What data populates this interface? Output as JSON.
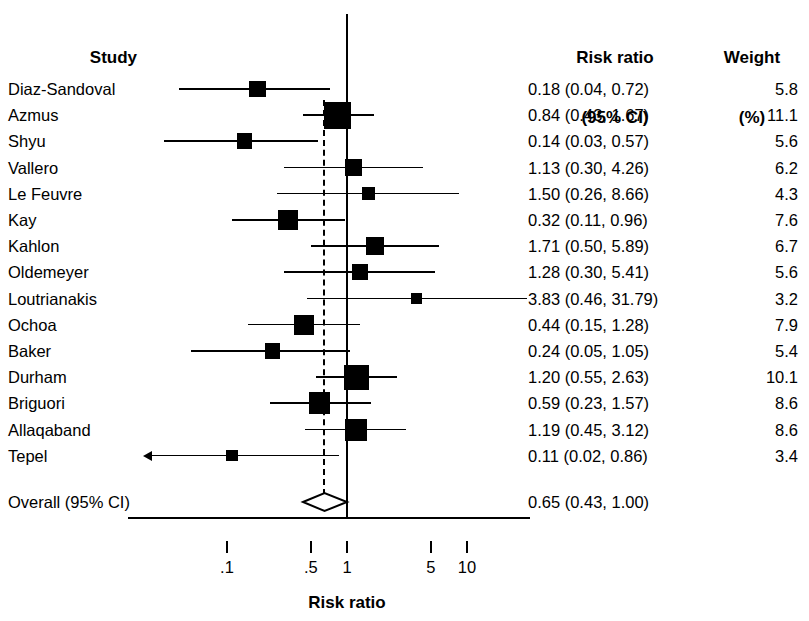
{
  "headers": {
    "study": "Study",
    "risk_ratio_line1": "Risk ratio",
    "risk_ratio_line2": "(95% CI)",
    "weight_line1": "Weight",
    "weight_line2": "(%)"
  },
  "overall": {
    "label": "Overall (95% CI)",
    "rr_text": "0.65 (0.43, 1.00)",
    "estimate": 0.65,
    "lower": 0.43,
    "upper": 1.0
  },
  "axis": {
    "title": "Risk ratio",
    "ticks": [
      ".1",
      ".5",
      "1",
      "5",
      "10"
    ],
    "tick_values": [
      0.1,
      0.5,
      1,
      5,
      10
    ],
    "scale": "log",
    "xmin": 0.07,
    "xmax": 17.0,
    "null_value": 1
  },
  "colors": {
    "ink": "#000000",
    "background": "#ffffff"
  },
  "chart_data": {
    "type": "forest",
    "title": "",
    "xlabel": "Risk ratio",
    "ylabel": "",
    "scale": "log",
    "xlim": [
      0.07,
      17.0
    ],
    "grid": false,
    "legend": "none",
    "null_line": 1,
    "pooled_line": 0.65,
    "columns": [
      "Study",
      "Risk ratio (95% CI)",
      "Weight (%)"
    ],
    "studies": [
      {
        "study": "Diaz-Sandoval",
        "rr": 0.18,
        "lower": 0.04,
        "upper": 0.72,
        "weight": 5.8,
        "rr_text": "0.18 (0.04, 0.72)",
        "weight_text": "5.8",
        "truncated_left": false,
        "truncated_right": false
      },
      {
        "study": "Azmus",
        "rr": 0.84,
        "lower": 0.43,
        "upper": 1.67,
        "weight": 11.1,
        "rr_text": "0.84 (0.43, 1.67)",
        "weight_text": "11.1",
        "truncated_left": false,
        "truncated_right": false
      },
      {
        "study": "Shyu",
        "rr": 0.14,
        "lower": 0.03,
        "upper": 0.57,
        "weight": 5.6,
        "rr_text": "0.14 (0.03, 0.57)",
        "weight_text": "5.6",
        "truncated_left": false,
        "truncated_right": false
      },
      {
        "study": "Vallero",
        "rr": 1.13,
        "lower": 0.3,
        "upper": 4.26,
        "weight": 6.2,
        "rr_text": "1.13 (0.30, 4.26)",
        "weight_text": "6.2",
        "truncated_left": false,
        "truncated_right": false
      },
      {
        "study": "Le Feuvre",
        "rr": 1.5,
        "lower": 0.26,
        "upper": 8.66,
        "weight": 4.3,
        "rr_text": "1.50 (0.26, 8.66)",
        "weight_text": "4.3",
        "truncated_left": false,
        "truncated_right": false
      },
      {
        "study": "Kay",
        "rr": 0.32,
        "lower": 0.11,
        "upper": 0.96,
        "weight": 7.6,
        "rr_text": "0.32 (0.11, 0.96)",
        "weight_text": "7.6",
        "truncated_left": false,
        "truncated_right": false
      },
      {
        "study": "Kahlon",
        "rr": 1.71,
        "lower": 0.5,
        "upper": 5.89,
        "weight": 6.7,
        "rr_text": "1.71 (0.50, 5.89)",
        "weight_text": "6.7",
        "truncated_left": false,
        "truncated_right": false
      },
      {
        "study": "Oldemeyer",
        "rr": 1.28,
        "lower": 0.3,
        "upper": 5.41,
        "weight": 5.6,
        "rr_text": "1.28 (0.30, 5.41)",
        "weight_text": "5.6",
        "truncated_left": false,
        "truncated_right": false
      },
      {
        "study": "Loutrianakis",
        "rr": 3.83,
        "lower": 0.46,
        "upper": 31.79,
        "weight": 3.2,
        "rr_text": "3.83 (0.46, 31.79)",
        "weight_text": "3.2",
        "truncated_left": false,
        "truncated_right": true
      },
      {
        "study": "Ochoa",
        "rr": 0.44,
        "lower": 0.15,
        "upper": 1.28,
        "weight": 7.9,
        "rr_text": "0.44 (0.15, 1.28)",
        "weight_text": "7.9",
        "truncated_left": false,
        "truncated_right": false
      },
      {
        "study": "Baker",
        "rr": 0.24,
        "lower": 0.05,
        "upper": 1.05,
        "weight": 5.4,
        "rr_text": "0.24 (0.05, 1.05)",
        "weight_text": "5.4",
        "truncated_left": false,
        "truncated_right": false
      },
      {
        "study": "Durham",
        "rr": 1.2,
        "lower": 0.55,
        "upper": 2.63,
        "weight": 10.1,
        "rr_text": "1.20 (0.55, 2.63)",
        "weight_text": "10.1",
        "truncated_left": false,
        "truncated_right": false
      },
      {
        "study": "Briguori",
        "rr": 0.59,
        "lower": 0.23,
        "upper": 1.57,
        "weight": 8.6,
        "rr_text": "0.59 (0.23, 1.57)",
        "weight_text": "8.6",
        "truncated_left": false,
        "truncated_right": false
      },
      {
        "study": "Allaqaband",
        "rr": 1.19,
        "lower": 0.45,
        "upper": 3.12,
        "weight": 8.6,
        "rr_text": "1.19 (0.45, 3.12)",
        "weight_text": "8.6",
        "truncated_left": false,
        "truncated_right": false
      },
      {
        "study": "Tepel",
        "rr": 0.11,
        "lower": 0.02,
        "upper": 0.86,
        "weight": 3.4,
        "rr_text": "0.11 (0.02, 0.86)",
        "weight_text": "3.4",
        "truncated_left": true,
        "truncated_right": false
      }
    ],
    "overall": {
      "study": "Overall (95% CI)",
      "rr": 0.65,
      "lower": 0.43,
      "upper": 1.0,
      "rr_text": "0.65 (0.43, 1.00)"
    }
  }
}
